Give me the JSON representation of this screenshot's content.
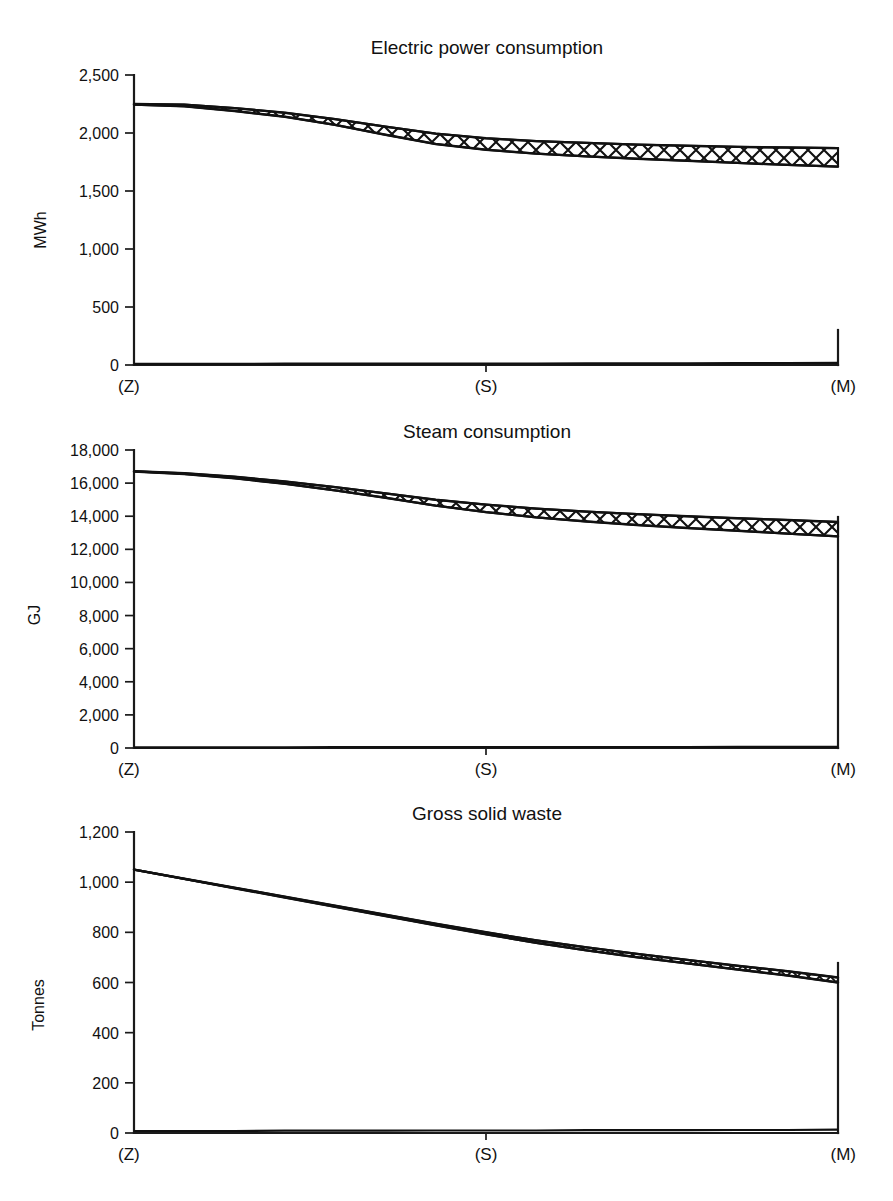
{
  "figure": {
    "panel_count": 3,
    "background": "#ffffff",
    "ink_color": "#111111"
  },
  "chart_data": [
    {
      "id": "electric-power-consumption",
      "type": "area",
      "title": "Electric power consumption",
      "xlabel": "",
      "ylabel": "MWh",
      "ylim": [
        0,
        2500
      ],
      "yticks": [
        0,
        500,
        1000,
        1500,
        2000,
        2500
      ],
      "ytick_labels": [
        "0",
        "500",
        "1,000",
        "1,500",
        "2,000",
        "2,500"
      ],
      "x": [
        0,
        0.5,
        1
      ],
      "xtick_labels": [
        "(Z)",
        "(S)",
        "(M)"
      ],
      "grid": false,
      "legend": null,
      "series": [
        {
          "name": "upper bound",
          "values": [
            2250,
            2245,
            2215,
            2175,
            2120,
            2055,
            1995,
            1955,
            1930,
            1915,
            1900,
            1890,
            1880,
            1875,
            1870
          ]
        },
        {
          "name": "lower bound",
          "values": [
            2245,
            2230,
            2190,
            2140,
            2070,
            1985,
            1905,
            1855,
            1822,
            1798,
            1778,
            1760,
            1742,
            1725,
            1710
          ]
        },
        {
          "name": "baseline",
          "values": [
            10,
            10,
            10,
            11,
            11,
            12,
            12,
            13,
            13,
            14,
            14,
            15,
            16,
            17,
            18
          ]
        }
      ],
      "band_fill_pattern": "cross-hatch"
    },
    {
      "id": "steam-consumption",
      "type": "area",
      "title": "Steam consumption",
      "xlabel": "",
      "ylabel": "GJ",
      "ylim": [
        0,
        18000
      ],
      "yticks": [
        0,
        2000,
        4000,
        6000,
        8000,
        10000,
        12000,
        14000,
        16000,
        18000
      ],
      "ytick_labels": [
        "0",
        "2,000",
        "4,000",
        "6,000",
        "8,000",
        "10,000",
        "12,000",
        "14,000",
        "16,000",
        "18,000"
      ],
      "x": [
        0,
        0.5,
        1
      ],
      "xtick_labels": [
        "(Z)",
        "(S)",
        "(M)"
      ],
      "grid": false,
      "legend": null,
      "series": [
        {
          "name": "upper bound",
          "values": [
            16720,
            16600,
            16380,
            16100,
            15760,
            15380,
            15000,
            14700,
            14460,
            14280,
            14130,
            14000,
            13880,
            13770,
            13650
          ]
        },
        {
          "name": "lower bound",
          "values": [
            16700,
            16550,
            16290,
            15960,
            15560,
            15110,
            14640,
            14250,
            13930,
            13680,
            13470,
            13290,
            13120,
            12950,
            12780
          ]
        },
        {
          "name": "baseline",
          "values": [
            40,
            40,
            42,
            44,
            46,
            48,
            50,
            52,
            55,
            58,
            60,
            63,
            66,
            70,
            74
          ]
        }
      ],
      "band_fill_pattern": "cross-hatch"
    },
    {
      "id": "gross-solid-waste",
      "type": "area",
      "title": "Gross solid waste",
      "xlabel": "",
      "ylabel": "Tonnes",
      "ylim": [
        0,
        1200
      ],
      "yticks": [
        0,
        200,
        400,
        600,
        800,
        1000,
        1200
      ],
      "ytick_labels": [
        "0",
        "200",
        "400",
        "600",
        "800",
        "1,000",
        "1,200"
      ],
      "x": [
        0,
        0.5,
        1
      ],
      "xtick_labels": [
        "(Z)",
        "(S)",
        "(M)"
      ],
      "grid": false,
      "legend": null,
      "series": [
        {
          "name": "upper bound",
          "values": [
            1050,
            1014,
            978,
            942,
            906,
            870,
            834,
            800,
            768,
            740,
            714,
            690,
            667,
            645,
            620
          ]
        },
        {
          "name": "lower bound",
          "values": [
            1050,
            1013,
            976,
            939,
            902,
            865,
            828,
            792,
            758,
            728,
            701,
            676,
            652,
            628,
            600
          ]
        },
        {
          "name": "baseline",
          "values": [
            8,
            8,
            8,
            9,
            9,
            9,
            10,
            10,
            10,
            11,
            11,
            11,
            12,
            12,
            13
          ]
        }
      ],
      "band_fill_pattern": "cross-hatch"
    }
  ]
}
